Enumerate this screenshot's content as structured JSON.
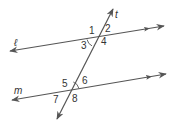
{
  "diagram": {
    "line_color": "#555555",
    "lines": {
      "l": {
        "label": "ℓ",
        "x1": 10,
        "y1": 51,
        "x2": 164,
        "y2": 26
      },
      "m": {
        "label": "m",
        "x1": 12,
        "y1": 100,
        "x2": 166,
        "y2": 74
      },
      "t": {
        "label": "t",
        "x1": 113,
        "y1": 9,
        "x2": 57,
        "y2": 119
      }
    },
    "angles": [
      {
        "id": "1",
        "label": "1",
        "x": 89,
        "y": 34
      },
      {
        "id": "2",
        "label": "2",
        "x": 105,
        "y": 32
      },
      {
        "id": "3",
        "label": "3",
        "x": 81,
        "y": 49
      },
      {
        "id": "4",
        "label": "4",
        "x": 101,
        "y": 45
      },
      {
        "id": "5",
        "label": "5",
        "x": 62,
        "y": 87
      },
      {
        "id": "6",
        "label": "6",
        "x": 82,
        "y": 84
      },
      {
        "id": "7",
        "label": "7",
        "x": 53,
        "y": 103
      },
      {
        "id": "8",
        "label": "8",
        "x": 72,
        "y": 102
      }
    ],
    "marked_angles": [
      "3",
      "6"
    ]
  }
}
